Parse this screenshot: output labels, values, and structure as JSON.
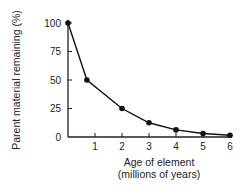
{
  "chart_data": {
    "type": "line",
    "title": "",
    "xlabel": "Age of element (millions of years)",
    "xlabel_lines": [
      "Age of element",
      "(millions of years)"
    ],
    "ylabel": "Parent material remaining (%)",
    "x": [
      0,
      0.7,
      2,
      3,
      4,
      5,
      6
    ],
    "series": [
      {
        "name": "Parent material remaining",
        "values": [
          100,
          50,
          25,
          12.5,
          6.25,
          3.1,
          1.6
        ]
      }
    ],
    "xticks": [
      1,
      2,
      3,
      4,
      5,
      6
    ],
    "yticks": [
      0,
      25,
      50,
      75,
      100
    ],
    "xlim": [
      0,
      6
    ],
    "ylim": [
      0,
      100
    ],
    "grid": false,
    "legend": "none",
    "colors": {
      "line": "#111111",
      "marker": "#111111",
      "axis": "#222222"
    }
  }
}
